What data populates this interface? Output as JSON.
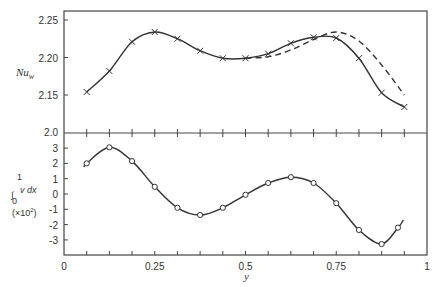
{
  "chart_data": [
    {
      "type": "line",
      "panel": "top",
      "ylabel": "Nu_w",
      "ylabel_main": "Nu",
      "ylabel_sub": "w",
      "xlabel": "y",
      "ylim": [
        2.0,
        2.26
      ],
      "y_ticks": [
        "2.25",
        "2.20",
        "2.15",
        "2.0"
      ],
      "y_tick_values": [
        2.25,
        2.2,
        2.15,
        2.0
      ],
      "axis_break_note": "2.0 at panel boundary (broken axis)",
      "grid": false,
      "series": [
        {
          "name": "computed (x markers)",
          "style": "solid",
          "marker": "x",
          "x": [
            0.0625,
            0.125,
            0.1875,
            0.25,
            0.3125,
            0.375,
            0.4375,
            0.5,
            0.5625,
            0.625,
            0.6875,
            0.75,
            0.8125,
            0.875,
            0.9375
          ],
          "values": [
            2.154,
            2.182,
            2.221,
            2.234,
            2.225,
            2.209,
            2.199,
            2.199,
            2.205,
            2.219,
            2.227,
            2.226,
            2.199,
            2.153,
            2.134
          ]
        },
        {
          "name": "alternative (dashed)",
          "style": "dashed",
          "marker": "none",
          "x": [
            0.5,
            0.5625,
            0.625,
            0.6875,
            0.75,
            0.8125,
            0.875,
            0.9375
          ],
          "values": [
            2.199,
            2.201,
            2.21,
            2.224,
            2.234,
            2.222,
            2.19,
            2.15
          ]
        }
      ]
    },
    {
      "type": "line",
      "panel": "bottom",
      "ylabel": "∫₀¹ v dx (×10²)",
      "ylabel_line1": "v dx",
      "ylabel_line2": "(×10",
      "ylabel_exp": "2",
      "ylabel_close": ")",
      "xlabel": "y",
      "ylim": [
        -4,
        3.5
      ],
      "xlim": [
        0,
        1
      ],
      "y_ticks": [
        "3",
        "2",
        "1",
        "0",
        "-1",
        "-2",
        "-3"
      ],
      "y_tick_values": [
        3,
        2,
        1,
        0,
        -1,
        -2,
        -3
      ],
      "x_ticks": [
        "0",
        "0.25",
        "0.5",
        "0.75",
        "1"
      ],
      "x_tick_values": [
        0,
        0.25,
        0.5,
        0.75,
        1
      ],
      "x_ticks_display": [
        "0",
        "0.25",
        "0.5",
        "0.75",
        "1"
      ],
      "grid": false,
      "series": [
        {
          "name": "integral of v (o markers)",
          "style": "solid",
          "marker": "o",
          "x": [
            0.0625,
            0.125,
            0.1875,
            0.25,
            0.3125,
            0.375,
            0.4375,
            0.5,
            0.5625,
            0.625,
            0.6875,
            0.75,
            0.8125,
            0.875,
            0.92
          ],
          "values": [
            2.0,
            3.05,
            2.15,
            0.47,
            -0.9,
            -1.37,
            -0.9,
            -0.05,
            0.72,
            1.1,
            0.72,
            -0.6,
            -2.35,
            -3.27,
            -2.2
          ]
        }
      ]
    }
  ],
  "labels": {
    "top_ylabel_main": "Nu",
    "top_ylabel_sub": "w",
    "bottom_int_lower": "0",
    "bottom_int_upper": "1",
    "bottom_ylabel_expr": "v dx",
    "bottom_ylabel_scale": "(×10",
    "bottom_ylabel_exp": "2",
    "bottom_ylabel_close": ")",
    "xlabel": "y",
    "top_ticks": [
      "2.25",
      "2.20",
      "2.15",
      "2.0"
    ],
    "bottom_ticks": [
      "3",
      "2",
      "1",
      "0",
      "-1",
      "-2",
      "-3"
    ],
    "x_ticks": [
      "0",
      "0.25",
      "0.5",
      "0.75",
      "1"
    ]
  }
}
